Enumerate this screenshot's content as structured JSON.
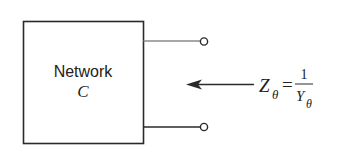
{
  "diagram": {
    "network_box": {
      "label_line1": "Network",
      "label_line2": "C"
    },
    "terminals": {
      "top": "terminal-top",
      "bottom": "terminal-bottom"
    },
    "equation": {
      "lhs_symbol": "Z",
      "lhs_subscript": "θ",
      "equals": "=",
      "numerator": "1",
      "denominator_symbol": "Y",
      "denominator_subscript": "θ"
    },
    "arrow": {
      "direction": "left"
    },
    "colors": {
      "stroke": "#2a2a2a",
      "top_lead": "#8a8a8a",
      "background": "#ffffff"
    }
  }
}
